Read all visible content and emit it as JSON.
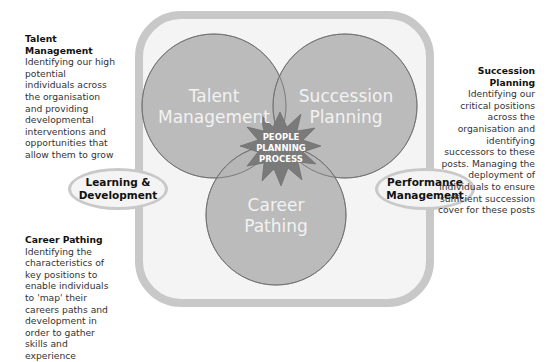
{
  "diagram": {
    "center_label": [
      "PEOPLE",
      "PLANNING",
      "PROCESS"
    ],
    "circles": [
      {
        "id": "talent",
        "lines": [
          "Talent",
          "Management"
        ]
      },
      {
        "id": "succession",
        "lines": [
          "Succession",
          "Planning"
        ]
      },
      {
        "id": "career",
        "lines": [
          "Career",
          "Pathing"
        ]
      }
    ],
    "side_ovals": {
      "left": {
        "line1": "Learning &",
        "line2": "Development"
      },
      "right": {
        "line1": "Performance",
        "line2": "Management"
      }
    },
    "colors": {
      "frame": "#c8c8c8",
      "frame_fill": "#f4f4f4",
      "circle_fill": "#b5b5b5",
      "circle_stroke": "#6e6e6e",
      "star_fill": "#7a7a7a",
      "circle_text": "#f2f2f2"
    }
  },
  "descriptions": {
    "talent": {
      "title": "Talent Management",
      "body": "Identifying our high potential individuals across the organisation and providing developmental interventions and opportunities that allow them to grow"
    },
    "succession": {
      "title": "Succession Planning",
      "body": "Identifying our critical positions across the organisation and identifying successors to these posts. Managing the deployment of individuals to ensure sufficient succession cover for these posts"
    },
    "career": {
      "title": "Career Pathing",
      "body": "Identifying the characteristics of key positions to enable individuals to 'map' their careers paths and development in order to gather skills and experience"
    }
  }
}
